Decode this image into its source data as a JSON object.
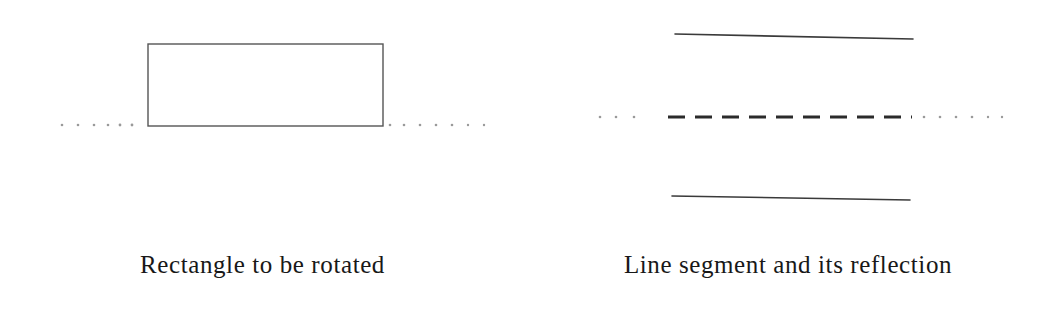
{
  "figure": {
    "background_color": "#ffffff",
    "ink_color": "#2b2b2b",
    "faint_dot_color": "#9a9a9a",
    "width": 1051,
    "height": 313,
    "panels": [
      {
        "id": "rectangle-panel",
        "caption": "Rectangle to be rotated",
        "axis": {
          "kind": "dotted-horizontal-axis",
          "y": 125,
          "x_start": 60,
          "x_end": 492,
          "dot_positions": [
            62,
            78,
            94,
            108,
            120,
            132,
            390,
            404,
            420,
            436,
            452,
            468,
            484
          ],
          "dot_radius": 1.3
        },
        "shapes": [
          {
            "kind": "rectangle",
            "x": 148,
            "y": 44,
            "width": 235,
            "height": 82,
            "stroke_width": 1.4,
            "fill": "none"
          }
        ]
      },
      {
        "id": "reflection-panel",
        "caption": "Line segment and its reflection",
        "axis": {
          "kind": "dashed-horizontal-axis",
          "y": 117,
          "x_start": 598,
          "x_end": 1002,
          "lead_dot_positions": [
            600,
            616,
            634,
            650
          ],
          "dash_start": 668,
          "dash_end": 912,
          "dash_length": 17,
          "dash_gap": 10,
          "trail_dot_positions": [
            924,
            940,
            956,
            972,
            988,
            1002
          ],
          "dot_radius": 1.3
        },
        "shapes": [
          {
            "kind": "line",
            "label": "original-segment",
            "x1": 675,
            "y1": 34,
            "x2": 913,
            "y2": 39,
            "stroke_width": 1.6
          },
          {
            "kind": "line",
            "label": "reflected-segment",
            "x1": 672,
            "y1": 196,
            "x2": 910,
            "y2": 200,
            "stroke_width": 1.6
          }
        ]
      }
    ]
  }
}
